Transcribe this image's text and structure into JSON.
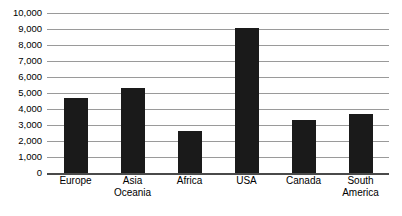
{
  "chart_data": {
    "type": "bar",
    "title": "",
    "subtitle": "",
    "xlabel": "",
    "ylabel": "",
    "categories": [
      "Europe",
      "Asia Oceania",
      "Africa",
      "USA",
      "Canada",
      "South\nAmerica"
    ],
    "values": [
      4700,
      5300,
      2600,
      9050,
      3300,
      3700
    ],
    "ylim": [
      0,
      10000
    ],
    "ytick_values": [
      0,
      1000,
      2000,
      3000,
      4000,
      5000,
      6000,
      7000,
      8000,
      9000,
      10000
    ],
    "ytick_labels": [
      "0",
      "1,000",
      "2,000",
      "3,000",
      "4,000",
      "5,000",
      "6,000",
      "7,000",
      "8,000",
      "9,000",
      "10,000"
    ],
    "grid": true,
    "legend": false,
    "legend_position": "none",
    "bar_color": "#1a1a1a",
    "gridline_color": "#9a9a9a",
    "axis_color": "#4a4a4a",
    "background_color": "#ffffff"
  }
}
